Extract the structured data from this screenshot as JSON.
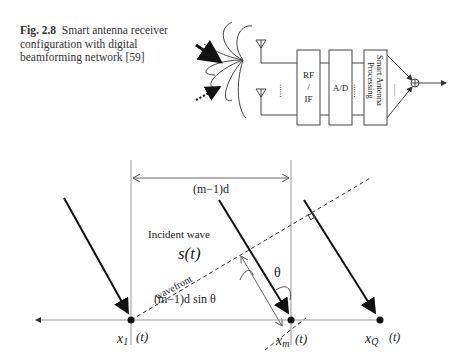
{
  "caption": {
    "figure_number": "Fig. 2.8",
    "text": "Smart antenna receiver configuration with digital beamforming network [59]"
  },
  "block_diagram": {
    "blocks": [
      {
        "id": "rf",
        "label_line1": "RF",
        "label_line2": "/",
        "label_line3": "IF"
      },
      {
        "id": "ad",
        "label": "A/D"
      },
      {
        "id": "sap",
        "label_line1": "Smart Antenna",
        "label_line2": "Processing"
      }
    ],
    "ellipsis": "......"
  },
  "geometry_diagram": {
    "spacing_label": "(m−1)d",
    "incident_wave_label": "Incident wave",
    "signal_label": "s(t)",
    "wavefront_label": "wavefront",
    "angle_label": "θ",
    "path_diff_label": "(m−1)d sin θ",
    "elements": [
      {
        "name": "x1",
        "symbol": "x₁",
        "arg": "(t)"
      },
      {
        "name": "xm",
        "symbol": "xₘ",
        "arg": "(t)"
      },
      {
        "name": "xQ",
        "symbol": "x_Q",
        "arg": "(t)"
      }
    ]
  }
}
